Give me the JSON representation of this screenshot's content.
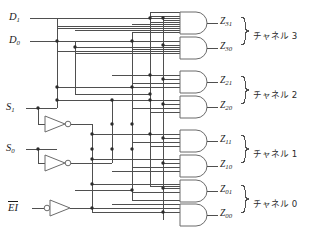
{
  "diagram": {
    "type": "logic-circuit-schematic",
    "language": "ja"
  },
  "inputs": [
    {
      "id": "D1",
      "base": "D",
      "sub": "1",
      "overline": false,
      "y": 18
    },
    {
      "id": "D0",
      "base": "D",
      "sub": "0",
      "overline": false,
      "y": 41
    },
    {
      "id": "S1",
      "base": "S",
      "sub": "1",
      "overline": false,
      "y": 108
    },
    {
      "id": "S0",
      "base": "S",
      "sub": "0",
      "overline": false,
      "y": 149
    },
    {
      "id": "EI",
      "base": "EI",
      "sub": "",
      "overline": true,
      "y": 208
    }
  ],
  "outputs": [
    {
      "id": "Z31",
      "base": "Z",
      "sub": "31",
      "y": 22
    },
    {
      "id": "Z30",
      "base": "Z",
      "sub": "30",
      "y": 47
    },
    {
      "id": "Z21",
      "base": "Z",
      "sub": "21",
      "y": 81
    },
    {
      "id": "Z20",
      "base": "Z",
      "sub": "20",
      "y": 106
    },
    {
      "id": "Z11",
      "base": "Z",
      "sub": "11",
      "y": 140
    },
    {
      "id": "Z10",
      "base": "Z",
      "sub": "10",
      "y": 165
    },
    {
      "id": "Z01",
      "base": "Z",
      "sub": "01",
      "y": 190
    },
    {
      "id": "Z00",
      "base": "Z",
      "sub": "00",
      "y": 214
    }
  ],
  "channels": [
    {
      "label": "チャネル 3",
      "y": 34
    },
    {
      "label": "チャネル 2",
      "y": 93
    },
    {
      "label": "チャネル 1",
      "y": 152
    },
    {
      "label": "チャネル 0",
      "y": 202
    }
  ],
  "gates": {
    "and_gate_count": 8,
    "and_gate_inputs": 4,
    "inverter_count": 3,
    "inverter_labels": [
      "S1-inverter",
      "S0-inverter",
      "EI-inverter"
    ]
  },
  "colors": {
    "wire": "#4f4f4f",
    "gate_outline": "#6b6b6b",
    "junction": "#2b2b2b",
    "text": "#1a1a1a",
    "background": "#ffffff"
  }
}
